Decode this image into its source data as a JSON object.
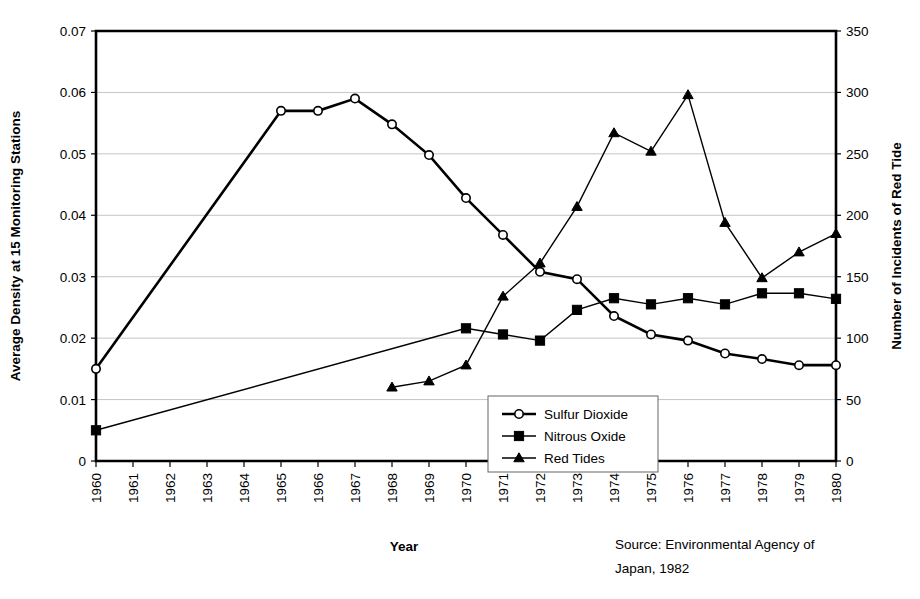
{
  "chart_data": {
    "type": "line",
    "title": "",
    "xlabel": "Year",
    "ylabel": "Average Density at 15 Monitoring Stations",
    "y2label": "Number of Incidents of Red Tide",
    "x": [
      1960,
      1961,
      1962,
      1963,
      1964,
      1965,
      1966,
      1967,
      1968,
      1969,
      1970,
      1971,
      1972,
      1973,
      1974,
      1975,
      1976,
      1977,
      1978,
      1979,
      1980
    ],
    "categories": [
      "1960",
      "1961",
      "1962",
      "1963",
      "1964",
      "1965",
      "1966",
      "1967",
      "1968",
      "1969",
      "1970",
      "1971",
      "1972",
      "1973",
      "1974",
      "1975",
      "1976",
      "1977",
      "1978",
      "1979",
      "1980"
    ],
    "xlim": [
      1960,
      1980
    ],
    "ylim": [
      0,
      0.07
    ],
    "y2lim": [
      0,
      350
    ],
    "yticks": [
      "0",
      "0.01",
      "0.02",
      "0.03",
      "0.04",
      "0.05",
      "0.06",
      "0.07"
    ],
    "ytick_values": [
      0,
      0.01,
      0.02,
      0.03,
      0.04,
      0.05,
      0.06,
      0.07
    ],
    "y2ticks": [
      "0",
      "50",
      "100",
      "150",
      "200",
      "250",
      "300",
      "350"
    ],
    "y2tick_values": [
      0,
      50,
      100,
      150,
      200,
      250,
      300,
      350
    ],
    "grid": true,
    "legend_position": "center",
    "series": [
      {
        "name": "Sulfur Dioxide",
        "marker": "open-circle",
        "axis": "left",
        "x": [
          1960,
          1965,
          1966,
          1967,
          1968,
          1969,
          1970,
          1971,
          1972,
          1973,
          1974,
          1975,
          1976,
          1977,
          1978,
          1979,
          1980
        ],
        "values": [
          0.015,
          0.057,
          0.057,
          0.059,
          0.0548,
          0.0498,
          0.0428,
          0.0368,
          0.0308,
          0.0296,
          0.0236,
          0.0206,
          0.0196,
          0.0175,
          0.0166,
          0.0156,
          0.0156
        ]
      },
      {
        "name": "Nitrous Oxide",
        "marker": "filled-square",
        "axis": "left",
        "x": [
          1960,
          1970,
          1971,
          1972,
          1973,
          1974,
          1975,
          1976,
          1977,
          1978,
          1979,
          1980
        ],
        "values": [
          0.005,
          0.0216,
          0.0206,
          0.0196,
          0.0246,
          0.0265,
          0.0255,
          0.0265,
          0.0255,
          0.0273,
          0.0273,
          0.0264
        ]
      },
      {
        "name": "Red Tides",
        "marker": "filled-triangle",
        "axis": "right",
        "x": [
          1968,
          1969,
          1970,
          1971,
          1972,
          1973,
          1974,
          1975,
          1976,
          1977,
          1978,
          1979,
          1980
        ],
        "values": [
          60,
          65,
          78,
          134,
          161,
          207,
          267,
          252,
          298,
          194,
          149,
          170,
          185
        ]
      }
    ],
    "source_note_line1": "Source: Environmental Agency of",
    "source_note_line2": "Japan, 1982"
  },
  "legend": {
    "items": [
      {
        "label": "Sulfur Dioxide",
        "marker": "open-circle"
      },
      {
        "label": "Nitrous Oxide",
        "marker": "filled-square"
      },
      {
        "label": "Red Tides",
        "marker": "filled-triangle"
      }
    ]
  },
  "labels": {
    "x_axis_title": "Year",
    "y_axis_title": "Average Density at 15 Monitoring Stations",
    "y2_axis_title": "Number of Incidents of Red Tide",
    "source_line1": "Source: Environmental Agency of",
    "source_line2": "Japan, 1982"
  }
}
